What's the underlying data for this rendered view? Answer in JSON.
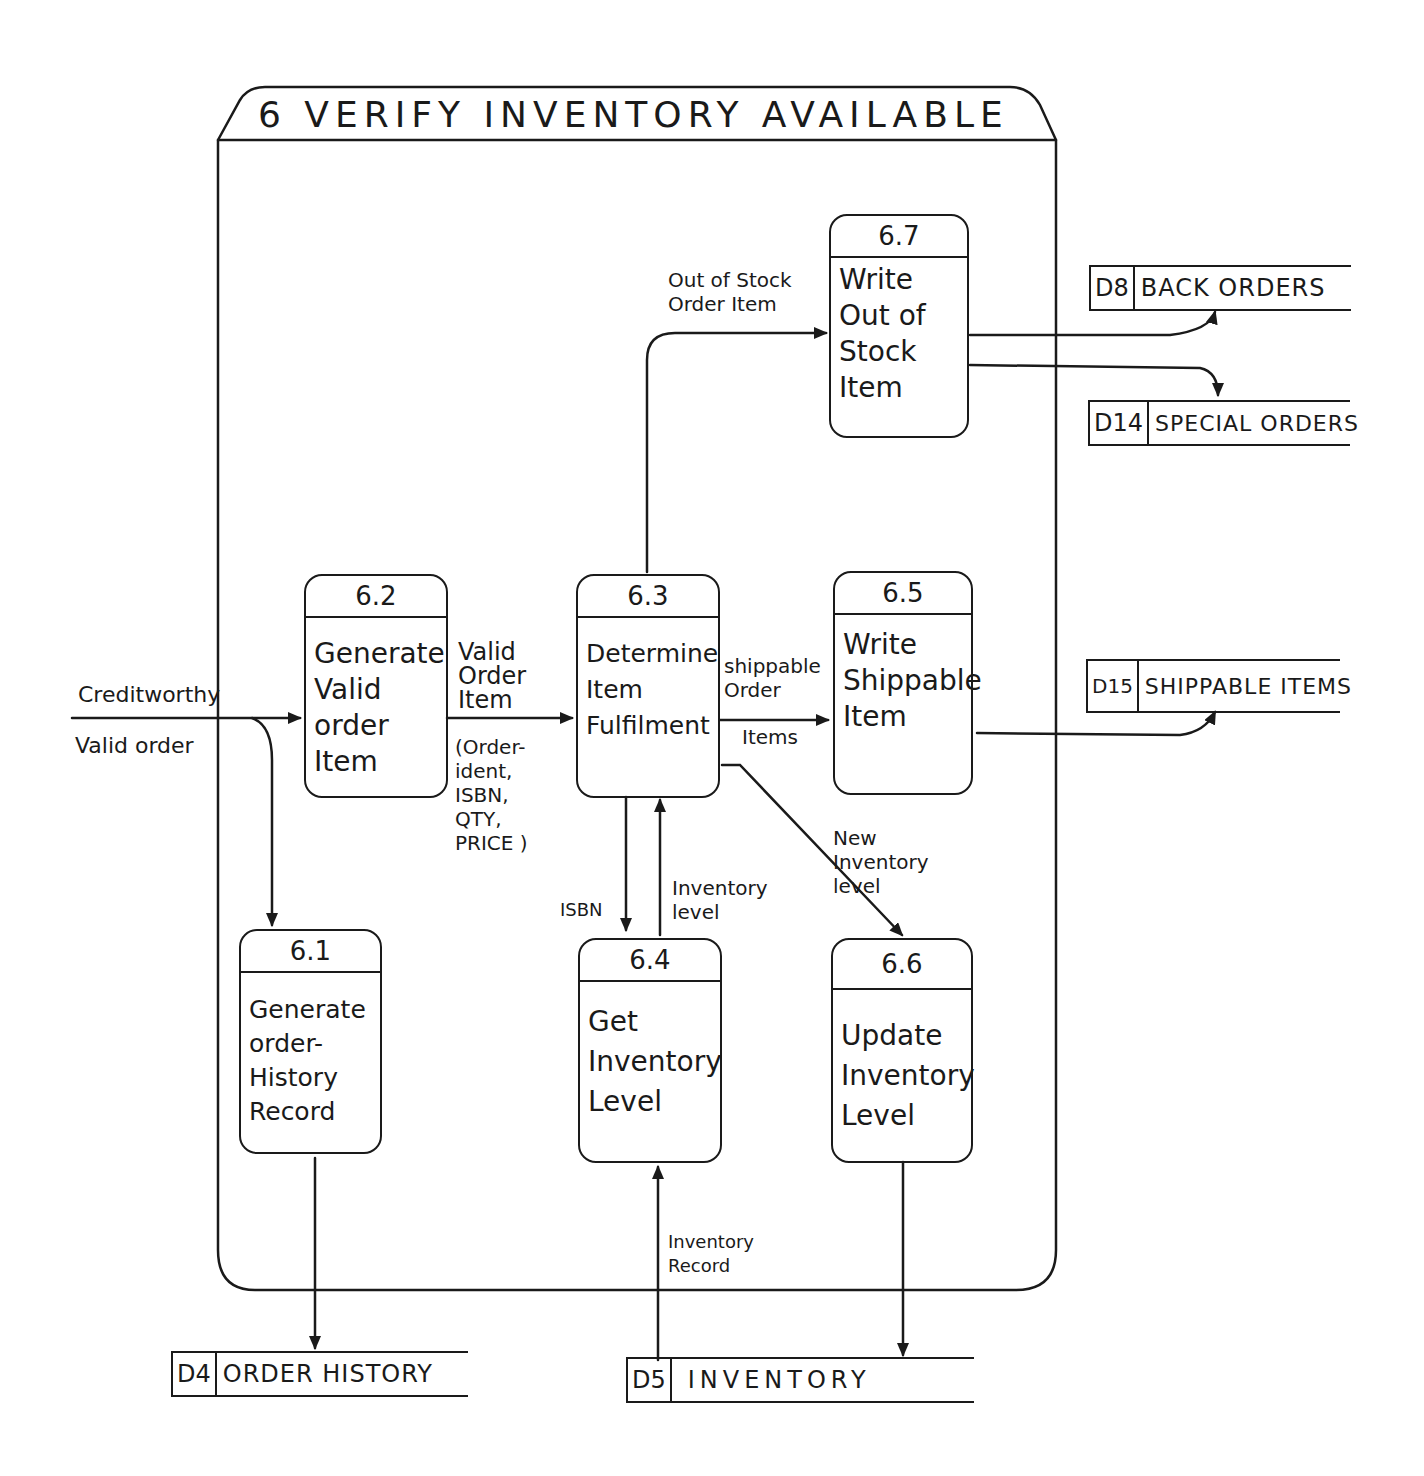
{
  "diagram": {
    "title": "6 VERIFY INVENTORY AVAILABLE",
    "processes": [
      {
        "id": "6.1",
        "name": "Generate\norder-\nHistory\nRecord"
      },
      {
        "id": "6.2",
        "name": "Generate\nValid\norder\nItem"
      },
      {
        "id": "6.3",
        "name": "Determine\nItem\nFulfilment"
      },
      {
        "id": "6.4",
        "name": "Get\nInventory\nLevel"
      },
      {
        "id": "6.5",
        "name": "Write\nShippable\nItem"
      },
      {
        "id": "6.6",
        "name": "Update\nInventory\nLevel"
      },
      {
        "id": "6.7",
        "name": "Write\nOut of\nStock\nItem"
      }
    ],
    "stores": [
      {
        "id": "D8",
        "name": "BACK ORDERS"
      },
      {
        "id": "D14",
        "name": "SPECIAL ORDERS"
      },
      {
        "id": "D15",
        "name": "SHIPPABLE ITEMS"
      },
      {
        "id": "D4",
        "name": "ORDER HISTORY"
      },
      {
        "id": "D5",
        "name": "INVENTORY"
      }
    ],
    "flows": {
      "creditworthy": "Creditworthy",
      "valid_order": "Valid order",
      "valid_order_item": "Valid\nOrder\nItem",
      "valid_order_item_detail": "(Order-\n ident,\nISBN,\nQTY,\nPRICE )",
      "shippable_order_items_top": "shippable\n Order",
      "shippable_order_items_bottom": "Items",
      "out_of_stock": "Out of Stock\n Order Item",
      "isbn": "ISBN",
      "inventory_level": "Inventory\n level",
      "new_inventory_level": "New\n Inventory\n   level",
      "inventory_record": "Inventory\n Record"
    }
  }
}
